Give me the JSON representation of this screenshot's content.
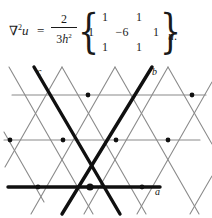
{
  "formula": {
    "lhs_nabla": "∇",
    "lhs_sup": "2",
    "lhs_var": "u",
    "equals": "=",
    "fraction": {
      "numerator": "2",
      "denominator_coeff": "3",
      "denominator_var": "h",
      "denominator_sup": "2"
    },
    "brace_left": "{",
    "brace_right": "}",
    "matrix": {
      "rows": [
        [
          "",
          "1",
          "",
          "1",
          ""
        ],
        [
          "1",
          "",
          "−6",
          "",
          "1"
        ],
        [
          "",
          "1",
          "",
          "1",
          ""
        ]
      ],
      "center_value": "−6",
      "neighbor_value": "1",
      "description": "hexagonal seven-point stencil"
    },
    "trailing_operand": "u",
    "trailing_period": "."
  },
  "diagram": {
    "labels": [
      {
        "text": "c",
        "x": 37,
        "y": 71
      },
      {
        "text": "b",
        "x": 152,
        "y": 71
      },
      {
        "text": "a",
        "x": 155,
        "y": 186
      }
    ],
    "colors": {
      "thin_line": "#8a8a8a",
      "bold_line": "#101010",
      "node": "#101010",
      "background": "#ffffff"
    },
    "geometry": {
      "rows_y": [
        33,
        78,
        125
      ],
      "column_spacing": 53,
      "hub": {
        "x": 90,
        "y": 125
      },
      "nodes": [
        {
          "x": 88,
          "y": 33
        },
        {
          "x": 192,
          "y": 33
        },
        {
          "x": 10,
          "y": 78
        },
        {
          "x": 63,
          "y": 78
        },
        {
          "x": 116,
          "y": 78
        },
        {
          "x": 168,
          "y": 78
        },
        {
          "x": 38,
          "y": 125
        },
        {
          "x": 90,
          "y": 125
        },
        {
          "x": 142,
          "y": 125
        }
      ]
    }
  }
}
